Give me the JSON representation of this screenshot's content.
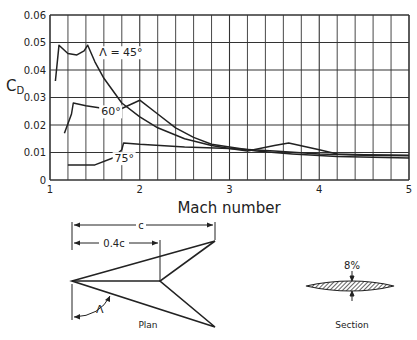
{
  "chart_data": {
    "type": "line",
    "title": "",
    "xlabel": "Mach number",
    "ylabel": "C_D",
    "ylabel_main": "C",
    "ylabel_sub": "D",
    "xlim": [
      1,
      5
    ],
    "ylim": [
      0,
      0.06
    ],
    "grid": true,
    "x_ticks": [
      "1",
      "2",
      "3",
      "4",
      "5"
    ],
    "y_ticks": [
      "0",
      "0.01",
      "0.02",
      "0.03",
      "0.04",
      "0.05",
      "0.06"
    ],
    "x_minor_step": 0.2,
    "series": [
      {
        "name": "Λ = 45°",
        "label": "Λ = 45°",
        "label_pos": [
          1.55,
          0.045
        ],
        "points": [
          [
            1.06,
            0.036
          ],
          [
            1.1,
            0.049
          ],
          [
            1.2,
            0.046
          ],
          [
            1.3,
            0.0455
          ],
          [
            1.38,
            0.047
          ],
          [
            1.42,
            0.049
          ],
          [
            1.5,
            0.043
          ],
          [
            1.6,
            0.037
          ],
          [
            1.8,
            0.028
          ],
          [
            2.0,
            0.023
          ],
          [
            2.2,
            0.019
          ],
          [
            2.5,
            0.015
          ],
          [
            2.8,
            0.0125
          ],
          [
            3.0,
            0.0115
          ],
          [
            3.5,
            0.0105
          ],
          [
            4.0,
            0.0095
          ],
          [
            4.5,
            0.009
          ],
          [
            5.0,
            0.0088
          ]
        ]
      },
      {
        "name": "60°",
        "label": "60°",
        "label_pos": [
          1.57,
          0.0235
        ],
        "points": [
          [
            1.16,
            0.017
          ],
          [
            1.24,
            0.024
          ],
          [
            1.26,
            0.028
          ],
          [
            1.4,
            0.027
          ],
          [
            1.6,
            0.026
          ],
          [
            1.8,
            0.026
          ],
          [
            2.0,
            0.029
          ],
          [
            2.2,
            0.024
          ],
          [
            2.4,
            0.019
          ],
          [
            2.6,
            0.0155
          ],
          [
            2.8,
            0.013
          ],
          [
            3.0,
            0.012
          ],
          [
            3.3,
            0.0105
          ],
          [
            3.7,
            0.0095
          ],
          [
            4.2,
            0.0085
          ],
          [
            5.0,
            0.008
          ]
        ]
      },
      {
        "name": "75°",
        "label": "75°",
        "label_pos": [
          1.72,
          0.0065
        ],
        "points": [
          [
            1.2,
            0.0055
          ],
          [
            1.5,
            0.0055
          ],
          [
            1.7,
            0.008
          ],
          [
            1.8,
            0.011
          ],
          [
            1.82,
            0.0135
          ],
          [
            2.0,
            0.013
          ],
          [
            2.5,
            0.012
          ],
          [
            3.0,
            0.0115
          ],
          [
            3.2,
            0.0105
          ],
          [
            3.5,
            0.0125
          ],
          [
            3.66,
            0.0135
          ],
          [
            4.0,
            0.011
          ],
          [
            4.2,
            0.0095
          ],
          [
            4.5,
            0.0092
          ],
          [
            5.0,
            0.009
          ]
        ]
      }
    ]
  },
  "diagram": {
    "plan_label": "Plan",
    "section_label": "Section",
    "chord_label": "c",
    "root_label": "0.4c",
    "sweep_label": "Λ",
    "thickness_label": "8%"
  },
  "colors": {
    "ink": "#222222",
    "grid": "#333333",
    "background": "#ffffff"
  }
}
